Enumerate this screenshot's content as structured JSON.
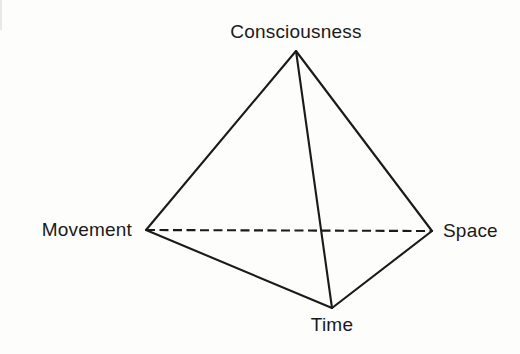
{
  "figure": {
    "name": "tetrahedron-diagram",
    "type": "tetrahedron",
    "background_color": "#fdfdfc",
    "line_color": "#1a1a1a",
    "label_color": "#1a1a1a"
  },
  "labels": {
    "top": "Consciousness",
    "left": "Movement",
    "right": "Space",
    "bottom": "Time"
  },
  "chart_data": {
    "type": "diagram",
    "title": "",
    "shape": "tetrahedron",
    "vertices": [
      {
        "id": "top",
        "label": "Consciousness",
        "x": 296,
        "y": 51
      },
      {
        "id": "left",
        "label": "Movement",
        "x": 146,
        "y": 230
      },
      {
        "id": "right",
        "label": "Space",
        "x": 432,
        "y": 231
      },
      {
        "id": "bottom",
        "label": "Time",
        "x": 332,
        "y": 308
      }
    ],
    "edges": [
      {
        "from": "top",
        "to": "left",
        "style": "solid"
      },
      {
        "from": "top",
        "to": "right",
        "style": "solid"
      },
      {
        "from": "top",
        "to": "bottom",
        "style": "solid"
      },
      {
        "from": "left",
        "to": "bottom",
        "style": "solid"
      },
      {
        "from": "right",
        "to": "bottom",
        "style": "solid"
      },
      {
        "from": "left",
        "to": "right",
        "style": "dashed"
      }
    ],
    "legend": [],
    "xlabel": "",
    "ylabel": ""
  }
}
